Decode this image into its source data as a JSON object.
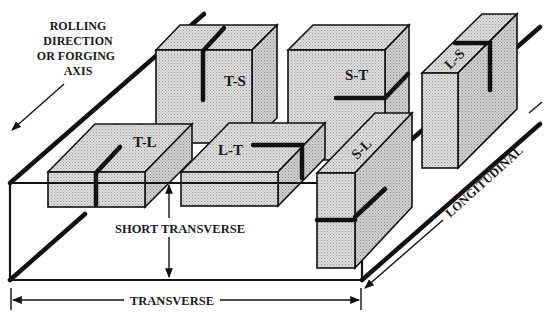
{
  "diagram": {
    "axis_labels": {
      "rolling_direction": [
        "ROLLING",
        "DIRECTION",
        "OR FORGING",
        "AXIS"
      ],
      "short_transverse": "SHORT TRANSVERSE",
      "transverse": "TRANSVERSE",
      "longitudinal": "LONGITUDINAL"
    },
    "specimens": [
      {
        "id": "T-S",
        "label": "T-S"
      },
      {
        "id": "S-T",
        "label": "S-T"
      },
      {
        "id": "L-S",
        "label": "L-S"
      },
      {
        "id": "T-L",
        "label": "T-L"
      },
      {
        "id": "L-T",
        "label": "L-T"
      },
      {
        "id": "S-L",
        "label": "S-L"
      }
    ],
    "colors": {
      "line": "#111111",
      "box_fill": "#d4d4d4",
      "box_side": "#c4c4c4",
      "box_top": "#dcdcdc",
      "background": "#ffffff"
    }
  }
}
